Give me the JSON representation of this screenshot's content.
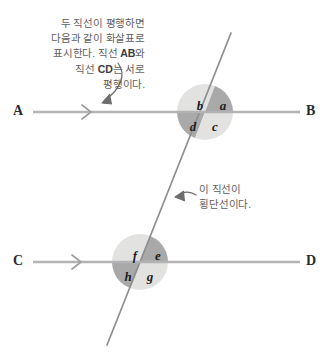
{
  "figure": {
    "kind": "geometry-diagram",
    "background_color": "#ffffff",
    "line_color": "#b3b3b5",
    "transversal_color": "#8e8e90",
    "sector_light_color": "#e2e2e0",
    "sector_dark_color": "#a9a9a9",
    "annotation_color": "#5e5e60",
    "label_color": "#1d1d1f"
  },
  "notes": {
    "parallel": {
      "line1": "두 직선이 평행하면",
      "line2": "다음과 같이 화살표로",
      "line3_a": "표시한다. 직선 ",
      "line3_b": "AB",
      "line3_c": "와",
      "line4_a": "직선 ",
      "line4_b": "CD",
      "line4_c": "는 서로",
      "line5": "평행이다."
    },
    "transversal": {
      "line1": "이 직선이",
      "line2": "횡단선이다."
    }
  },
  "endpoints": {
    "a": "A",
    "b": "B",
    "c": "C",
    "d": "D"
  },
  "angles": {
    "upper": [
      {
        "id": "a",
        "label": "a",
        "quadrant": "top-right",
        "shade": "dark",
        "x": 216,
        "y": 99
      },
      {
        "id": "b",
        "label": "b",
        "quadrant": "top-left",
        "shade": "light",
        "x": 193,
        "y": 99
      },
      {
        "id": "c",
        "label": "c",
        "quadrant": "bottom-right",
        "shade": "light",
        "x": 208,
        "y": 120
      },
      {
        "id": "d",
        "label": "d",
        "quadrant": "bottom-left",
        "shade": "dark",
        "x": 186,
        "y": 120
      }
    ],
    "lower": [
      {
        "id": "e",
        "label": "e",
        "quadrant": "top-right",
        "shade": "dark",
        "x": 151,
        "y": 249
      },
      {
        "id": "f",
        "label": "f",
        "quadrant": "top-left",
        "shade": "light",
        "x": 128,
        "y": 249
      },
      {
        "id": "g",
        "label": "g",
        "quadrant": "bottom-right",
        "shade": "light",
        "x": 143,
        "y": 270
      },
      {
        "id": "h",
        "label": "h",
        "quadrant": "bottom-left",
        "shade": "dark",
        "x": 121,
        "y": 270
      }
    ]
  },
  "geometry": {
    "line_ab": {
      "x1": 33,
      "y1": 112,
      "x2": 300,
      "y2": 112
    },
    "line_cd": {
      "x1": 33,
      "y1": 262,
      "x2": 300,
      "y2": 262
    },
    "transversal": {
      "x1": 231,
      "y1": 33,
      "x2": 107,
      "y2": 345
    },
    "circle_upper": {
      "cx": 205,
      "cy": 112,
      "r": 28
    },
    "circle_lower": {
      "cx": 140,
      "cy": 262,
      "r": 28
    },
    "arrow_marker_ab": {
      "x": 88,
      "y": 112
    },
    "arrow_marker_cd": {
      "x": 78,
      "y": 262
    }
  }
}
